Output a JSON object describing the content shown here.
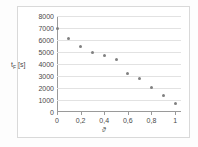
{
  "chart_data": {
    "type": "scatter",
    "title": "",
    "xlabel": "ϑ",
    "ylabel": "tF [s]",
    "ylabel_main": "t",
    "ylabel_sub": "F",
    "ylabel_unit": " [s]",
    "x": [
      0,
      0.1,
      0.2,
      0.3,
      0.4,
      0.5,
      0.6,
      0.7,
      0.8,
      0.9,
      1
    ],
    "values": [
      7000,
      6100,
      5500,
      4950,
      4750,
      4400,
      3200,
      2800,
      2050,
      1350,
      750
    ],
    "xlim": [
      0,
      1.05
    ],
    "ylim": [
      0,
      8000
    ],
    "ytick_values": [
      8000,
      7000,
      6000,
      5000,
      4000,
      3000,
      2000,
      1000,
      0
    ],
    "ytick_labels": [
      "8000",
      "7000",
      "6000",
      "5000",
      "4000",
      "3000",
      "2000",
      "1000",
      "0"
    ],
    "xtick_values": [
      0,
      0.2,
      0.4,
      0.6,
      0.8,
      1
    ],
    "xtick_labels": [
      "0",
      "0,2",
      "0,4",
      "0,6",
      "0,8",
      "1"
    ],
    "grid": "horizontal",
    "legend": null,
    "marker_color": "#808080",
    "grid_color": "#e2e2e2",
    "axis_color": "#9a9a9a",
    "text_color": "#4a4a4a"
  }
}
